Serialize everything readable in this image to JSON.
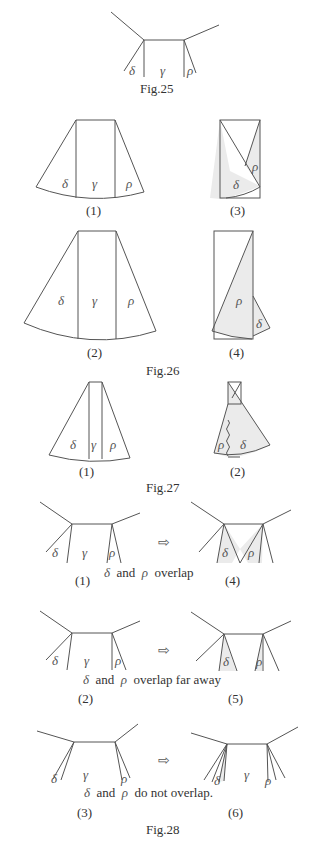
{
  "symbols": {
    "delta": "δ",
    "gamma": "γ",
    "rho": "ρ",
    "arrow": "⇨"
  },
  "fig25": {
    "caption": "Fig.25"
  },
  "fig26": {
    "caption": "Fig.26",
    "panels": [
      {
        "label": "(1)"
      },
      {
        "label": "(2)"
      },
      {
        "label": "(3)"
      },
      {
        "label": "(4)"
      }
    ]
  },
  "fig27": {
    "caption": "Fig.27",
    "panels": [
      {
        "label": "(1)"
      },
      {
        "label": "(2)"
      }
    ]
  },
  "fig28": {
    "caption": "Fig.28",
    "rows": [
      {
        "left": "(1)",
        "right": "(4)",
        "text_and": "and",
        "text_tail": "overlap"
      },
      {
        "left": "(2)",
        "right": "(5)",
        "text_and": "and",
        "text_tail": "overlap far away"
      },
      {
        "left": "(3)",
        "right": "(6)",
        "text_and": "and",
        "text_tail": "do not overlap."
      }
    ]
  },
  "colors": {
    "line": "#555555",
    "shade": "#ebebeb",
    "background": "#ffffff"
  }
}
